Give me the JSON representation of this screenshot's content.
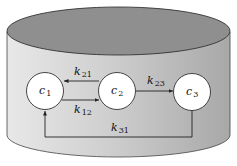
{
  "diagram": {
    "type": "three-compartment model in a cylindrical container",
    "compartments": [
      {
        "id": "c1",
        "label": "c",
        "sub": "1"
      },
      {
        "id": "c2",
        "label": "c",
        "sub": "2"
      },
      {
        "id": "c3",
        "label": "c",
        "sub": "3"
      }
    ],
    "edges": [
      {
        "from": "c2",
        "to": "c1",
        "label": "k",
        "sub": "21"
      },
      {
        "from": "c1",
        "to": "c2",
        "label": "k",
        "sub": "12"
      },
      {
        "from": "c2",
        "to": "c3",
        "label": "k",
        "sub": "23"
      },
      {
        "from": "c3",
        "to": "c1",
        "label": "k",
        "sub": "31"
      }
    ],
    "colors": {
      "top": "#8f8f8f",
      "side_light": "#e6e6e6",
      "side_dark": "#a9a9a9",
      "node_fill": "#ffffff",
      "stroke": "#333333"
    }
  }
}
